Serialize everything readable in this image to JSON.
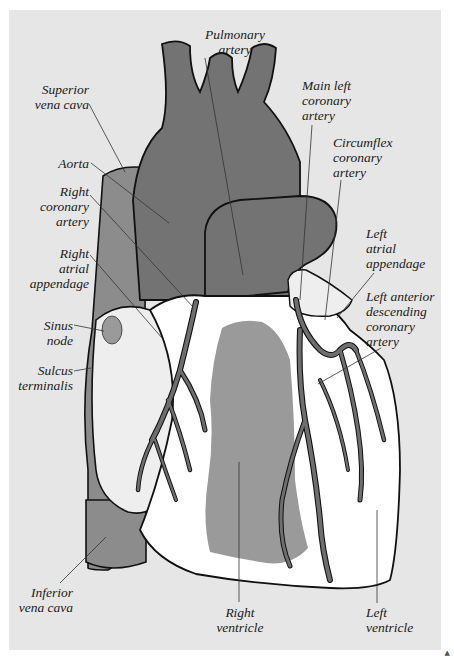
{
  "figure": {
    "colors": {
      "background_panel": "#e6e6e6",
      "great_vessels": "#737373",
      "vena_cava": "#8c8c8c",
      "right_ventricle_region": "#9a9a9a",
      "heart_surface": "#ffffff",
      "atrium_surface": "#eeeeee",
      "coronary_arteries": "#6e6e6e",
      "outline": "#111111",
      "leader_lines": "#333333"
    },
    "corner_mark": "▲"
  },
  "labels": {
    "pulmonary_artery": "Pulmonary\nartery",
    "superior_vena_cava": "Superior\nvena cava",
    "main_left_coronary_artery": "Main left\ncoronary\nartery",
    "aorta": "Aorta",
    "circumflex_coronary_artery": "Circumflex\ncoronary\nartery",
    "right_coronary_artery": "Right\ncoronary\nartery",
    "left_atrial_appendage": "Left\natrial\nappendage",
    "right_atrial_appendage": "Right\natrial\nappendage",
    "left_anterior_descending_coronary_artery": "Left anterior\ndescending\ncoronary\nartery",
    "sinus_node": "Sinus\nnode",
    "sulcus_terminalis": "Sulcus\nterminalis",
    "inferior_vena_cava": "Inferior\nvena cava",
    "right_ventricle": "Right\nventricle",
    "left_ventricle": "Left\nventricle"
  }
}
